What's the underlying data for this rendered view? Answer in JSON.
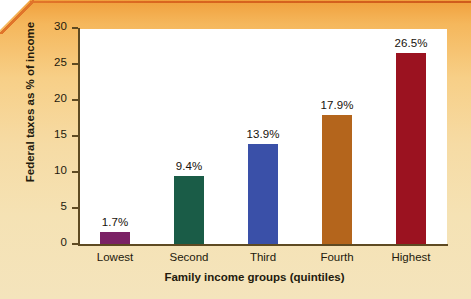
{
  "chart_data": {
    "type": "bar",
    "title": "",
    "subtitle": "",
    "xlabel": "Family income groups (quintiles)",
    "ylabel": "Federal taxes as % of income",
    "categories": [
      "Lowest",
      "Second",
      "Third",
      "Fourth",
      "Highest"
    ],
    "values": [
      1.7,
      9.4,
      13.9,
      17.9,
      26.5
    ],
    "value_labels": [
      "1.7%",
      "9.4%",
      "13.9%",
      "17.9%",
      "26.5%"
    ],
    "bar_colors": [
      "#7B2265",
      "#1A5C47",
      "#3A50A8",
      "#B4651C",
      "#9B1220"
    ],
    "ylim": [
      0,
      30
    ],
    "yticks": [
      0,
      5,
      10,
      15,
      20,
      25,
      30
    ],
    "ytick_labels": [
      "0",
      "5",
      "10",
      "15",
      "20",
      "25",
      "30"
    ],
    "grid": false,
    "legend": "none",
    "plot_background": "#FFFFFF",
    "figure_background_top": "#F0A03C",
    "figure_background_bottom": "#F4E4BC",
    "axis_color": "#5E4A22"
  }
}
